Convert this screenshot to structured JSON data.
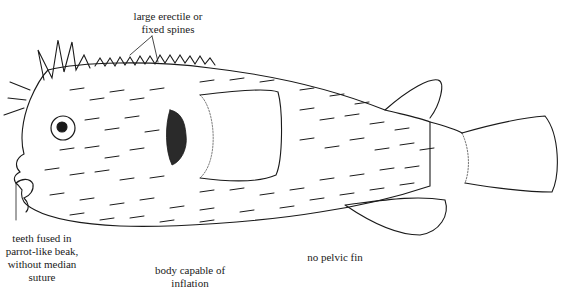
{
  "diagram": {
    "labels": {
      "spines": [
        "large erectile or",
        "fixed spines"
      ],
      "teeth": [
        "teeth fused in",
        "parrot-like beak,",
        "without median",
        "suture"
      ],
      "body": [
        "body capable of",
        "inflation"
      ],
      "pelvic": [
        "no pelvic fin"
      ]
    },
    "colors": {
      "line": "#1a1a1a",
      "background": "#ffffff"
    }
  }
}
